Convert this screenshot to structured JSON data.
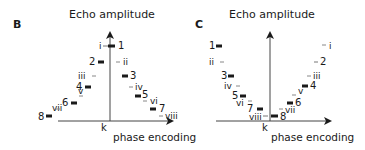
{
  "colors": {
    "ink": "#1a1a1a",
    "thin": "#8a8a8a",
    "axis": "#555555"
  },
  "panels": [
    {
      "id": "B",
      "letter": "B",
      "y_label": "Echo amplitude",
      "x_label": "phase encoding",
      "center_label": "k",
      "description": "Centric (linear) ordering: amplitudes peak at k-space center"
    },
    {
      "id": "C",
      "letter": "C",
      "y_label": "Echo amplitude",
      "x_label": "phase encoding",
      "center_label": "k",
      "description": "Reversed ordering: low amplitudes at k-space center"
    }
  ],
  "echo_numbers": [
    "1",
    "2",
    "3",
    "4",
    "5",
    "6",
    "7",
    "8"
  ],
  "echo_numerals": [
    "i",
    "ii",
    "iii",
    "iv",
    "v",
    "vi",
    "vii",
    "viii"
  ]
}
